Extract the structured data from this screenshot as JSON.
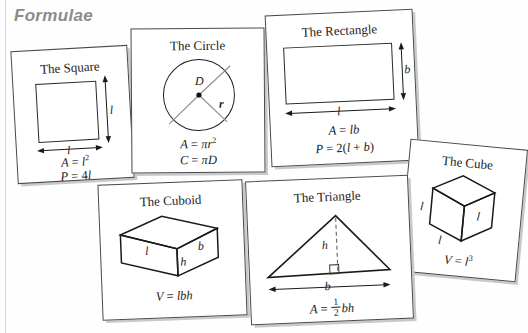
{
  "page": {
    "title": "Formulae",
    "title_color": "#8c8c8c",
    "background": "#ffffff"
  },
  "cards": {
    "square": {
      "title": "The Square",
      "side_label": "l",
      "base_label": "l",
      "formula_area": "A = l2",
      "formula_perimeter": "P = 4l"
    },
    "circle": {
      "title": "The Circle",
      "diameter_label": "D",
      "radius_label": "r",
      "formula_area": "A = πr2",
      "formula_circumference": "C = πD"
    },
    "rectangle": {
      "title": "The Rectangle",
      "height_label": "b",
      "width_label": "l",
      "formula_area": "A = lb",
      "formula_perimeter": "P = 2(l + b)"
    },
    "cube": {
      "title": "The Cube",
      "edge_label_left": "l",
      "edge_label_right": "l",
      "edge_label_bottom": "l",
      "formula_volume": "V = l3"
    },
    "cuboid": {
      "title": "The Cuboid",
      "length_label": "l",
      "breadth_label": "b",
      "height_label": "h",
      "formula_volume": "V = lbh"
    },
    "triangle": {
      "title": "The Triangle",
      "height_label": "h",
      "base_label": "b",
      "formula_area": "A = 1/2 bh"
    }
  }
}
